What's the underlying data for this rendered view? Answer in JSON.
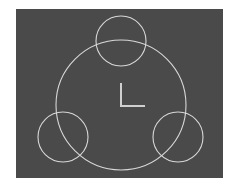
{
  "drawing": {
    "description": "Large circle with three smaller circles spaced at 120 degrees and a UCS axis icon at center",
    "colors": {
      "background": "#4a4a4a",
      "page": "#ffffff",
      "stroke": "#d8d8d8"
    },
    "entities": [
      {
        "type": "circle",
        "role": "main-circle"
      },
      {
        "type": "circle",
        "role": "small-circle-top"
      },
      {
        "type": "circle",
        "role": "small-circle-bottom-left"
      },
      {
        "type": "circle",
        "role": "small-circle-bottom-right"
      },
      {
        "type": "ucs-icon",
        "role": "axis-marker"
      }
    ]
  }
}
